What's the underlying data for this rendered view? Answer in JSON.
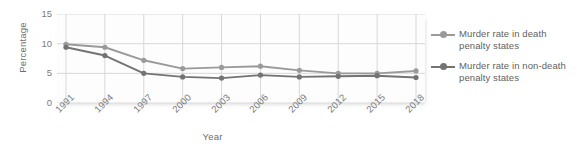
{
  "chart_data": {
    "type": "line",
    "title": "",
    "subtitle": "",
    "xlabel": "Year",
    "ylabel": "Percentage",
    "categories": [
      "1991",
      "1994",
      "1997",
      "2000",
      "2003",
      "2006",
      "2009",
      "2012",
      "2015",
      "2018"
    ],
    "ylim": [
      0,
      15
    ],
    "yticks": [
      0,
      5,
      10,
      15
    ],
    "ytick_labels": [
      "0",
      "5",
      "10",
      "15"
    ],
    "grid": true,
    "legend_position": "right",
    "series": [
      {
        "name": "Murder rate in death penalty states",
        "color": "#9a9a9a",
        "values": [
          9.9,
          9.4,
          7.2,
          5.8,
          6.0,
          6.2,
          5.5,
          5.0,
          5.0,
          5.4
        ]
      },
      {
        "name": "Murder rate in non-death penalty states",
        "color": "#737373",
        "values": [
          9.4,
          8.0,
          5.0,
          4.4,
          4.2,
          4.7,
          4.4,
          4.5,
          4.6,
          4.3
        ]
      }
    ]
  },
  "legend": {
    "entries": [
      {
        "label": "Murder rate in death penalty states"
      },
      {
        "label": "Murder rate in non-death penalty states"
      }
    ]
  },
  "colors": {
    "series_light": "#9a9a9a",
    "series_dark": "#737373",
    "grid": "#d8d8d8",
    "axis_text": "#7a7a7a",
    "plot_background": "#fdfdfd",
    "page_background": "#ffffff"
  }
}
